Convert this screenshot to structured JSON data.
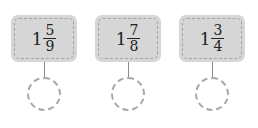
{
  "items": [
    {
      "whole": "1",
      "numerator": "5",
      "denominator": "9",
      "answer": ""
    },
    {
      "whole": "1",
      "numerator": "7",
      "denominator": "8",
      "answer": ""
    },
    {
      "whole": "1",
      "numerator": "3",
      "denominator": "4",
      "answer": ""
    }
  ],
  "colors": {
    "box_fill": "#d6d6d6",
    "dash": "#a3a3a3",
    "text": "#222222"
  }
}
